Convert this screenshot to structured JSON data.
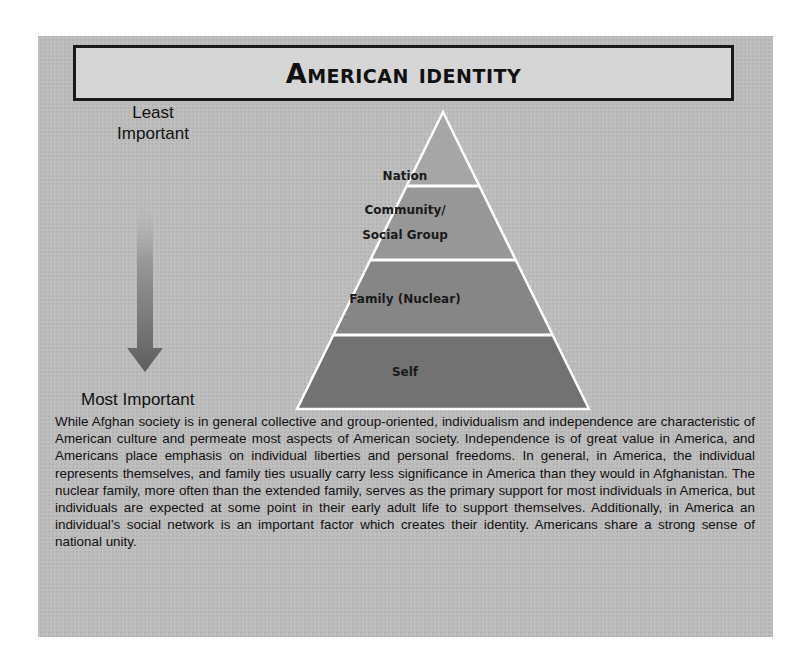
{
  "title": "American Identity",
  "scale": {
    "top_label": "Least Important",
    "top_label_lines": [
      "Least",
      "Important"
    ],
    "bottom_label": "Most Important",
    "arrow_direction": "down"
  },
  "pyramid": {
    "tiers": [
      {
        "label": "Nation",
        "color": "#a6a6a6"
      },
      {
        "label_lines": [
          "Community/",
          "Social Group"
        ],
        "label": "Community/ Social Group",
        "color": "#979797"
      },
      {
        "label": "Family (Nuclear)",
        "color": "#868686"
      },
      {
        "label": "Self",
        "color": "#727272"
      }
    ],
    "outline_color": "#ffffff"
  },
  "body": {
    "paragraph": "While Afghan society is in general collective and group-oriented, individualism and independence are characteristic of American culture and permeate most aspects of American society.  Independence is of great value in America, and Americans place emphasis on individual liberties and personal freedoms.  In general, in America, the individual represents themselves, and family ties usually carry less significance in America than they would in Afghanistan.  The nuclear family, more often than the extended family, serves as the primary support for most individuals in America, but individuals are expected at some point in their early adult life to support themselves.  Additionally, in America an individual’s social network is an important factor which creates their identity.  Americans share a strong sense of national unity."
  },
  "colors": {
    "panel": "#bdbdbd",
    "title_box": "#d6d6d6",
    "border": "#1a1a1a",
    "text": "#111111"
  }
}
